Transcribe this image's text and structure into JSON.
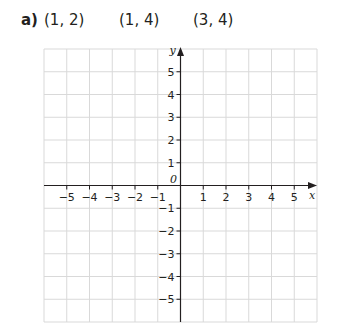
{
  "question": {
    "label": "a)",
    "points": [
      {
        "text": "(1, 2)",
        "x": 1,
        "y": 2
      },
      {
        "text": "(1, 4)",
        "x": 1,
        "y": 4
      },
      {
        "text": "(3, 4)",
        "x": 3,
        "y": 4
      }
    ]
  },
  "grid": {
    "x_range": [
      -6,
      6
    ],
    "y_range": [
      -6,
      6
    ],
    "x_ticks": [
      -5,
      -4,
      -3,
      -2,
      -1,
      1,
      2,
      3,
      4,
      5
    ],
    "y_ticks": [
      5,
      4,
      3,
      2,
      1,
      -1,
      -2,
      -3,
      -4,
      -5
    ],
    "x_tick_labels": [
      "−5",
      "−4",
      "−3",
      "−2",
      "−1",
      "1",
      "2",
      "3",
      "4",
      "5"
    ],
    "y_tick_labels": [
      "5",
      "4",
      "3",
      "2",
      "1",
      "−1",
      "−2",
      "−3",
      "−4",
      "−5"
    ],
    "origin_label": "0",
    "x_axis_label": "x",
    "y_axis_label": "y",
    "colors": {
      "gridline": "#d9d9d9",
      "axis": "#231f20",
      "text": "#231f20"
    }
  }
}
